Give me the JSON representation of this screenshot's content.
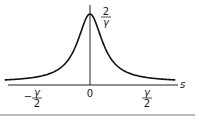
{
  "chart_data": {
    "type": "line",
    "title": "",
    "xlabel": "s",
    "ylabel": "",
    "function": "Lorentzian peak centered at 0 with full width gamma",
    "peak_value_label": {
      "num": "2",
      "den": "γ"
    },
    "x_tick_labels": [
      {
        "value": -0.5,
        "sign": "−",
        "num": "γ",
        "den": "2"
      },
      {
        "value": 0,
        "text": "0"
      },
      {
        "value": 0.5,
        "sign": "",
        "num": "γ",
        "den": "2"
      }
    ],
    "xlim": [
      -1.55,
      1.55
    ],
    "peak": 1.0,
    "half_width": 0.5,
    "grid": false,
    "legend": "none"
  }
}
